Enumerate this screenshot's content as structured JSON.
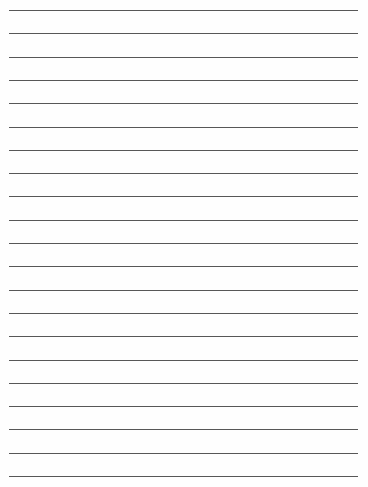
{
  "paper": {
    "type": "lined-paper",
    "background": "#fefefe",
    "line_color": "#3a3a3a",
    "line_count": 21,
    "first_line_y": 10,
    "line_spacing": 23.3,
    "line_left": 9,
    "line_right": 358
  }
}
